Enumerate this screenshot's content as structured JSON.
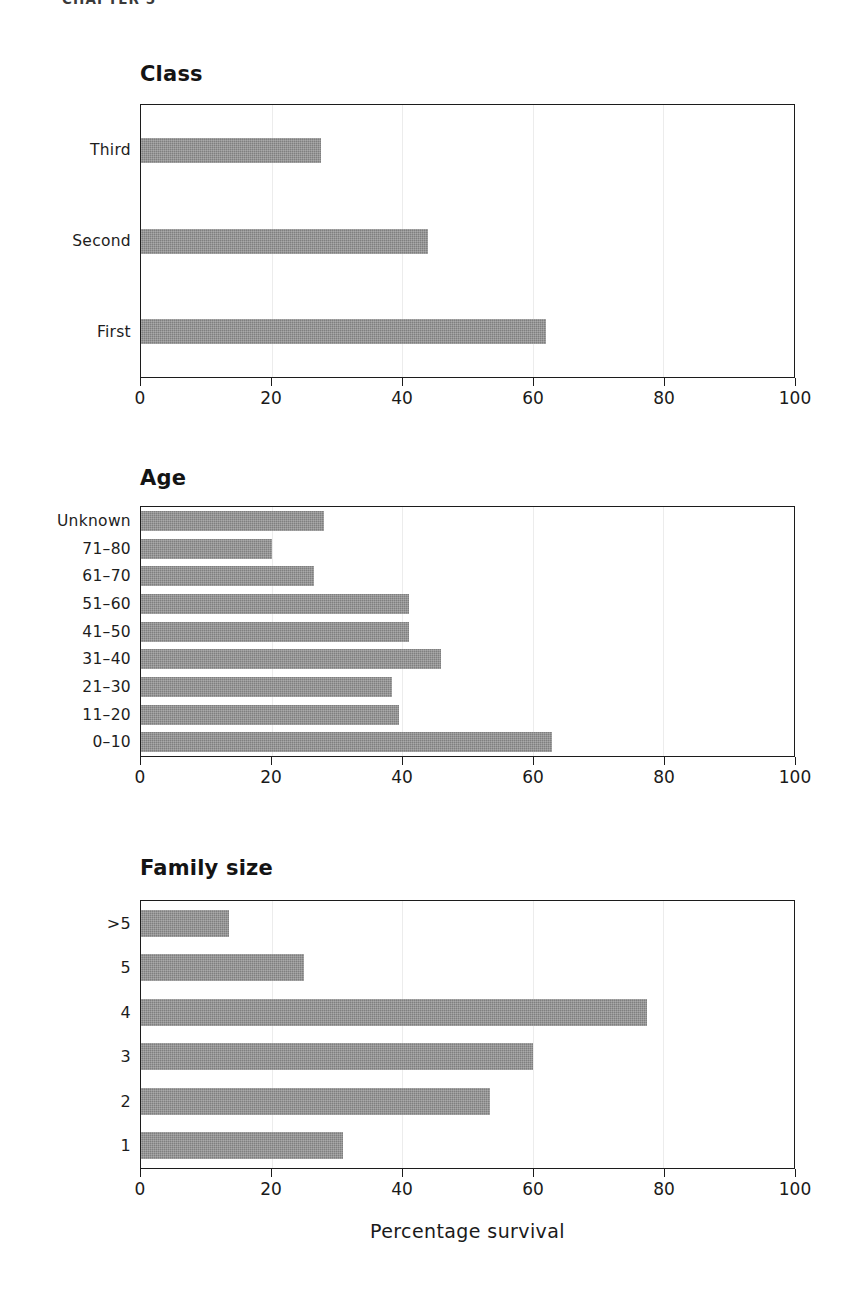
{
  "running_head": "CHAPTER 5",
  "axis": {
    "title": "Percentage survival",
    "ticks": [
      0,
      20,
      40,
      60,
      80,
      100
    ],
    "tick_labels": [
      "0",
      "20",
      "40",
      "60",
      "80",
      "100"
    ],
    "min": 0,
    "max": 100
  },
  "colors": {
    "bar_fill": "#7f7f7f",
    "frame": "#1c1c1c",
    "gridline": "#ececec",
    "text": "#1a1a1a",
    "background": "#ffffff"
  },
  "panels": [
    {
      "id": "class",
      "title": "Class",
      "categories": [
        "Third",
        "Second",
        "First"
      ],
      "values": [
        27.5,
        44.0,
        62.0
      ]
    },
    {
      "id": "age",
      "title": "Age",
      "categories": [
        "Unknown",
        "71–80",
        "61–70",
        "51–60",
        "41–50",
        "31–40",
        "21–30",
        "11–20",
        "0–10"
      ],
      "values": [
        28.0,
        20.0,
        26.5,
        41.0,
        41.0,
        46.0,
        38.5,
        39.5,
        63.0
      ]
    },
    {
      "id": "family",
      "title": "Family size",
      "categories": [
        ">5",
        "5",
        "4",
        "3",
        "2",
        "1"
      ],
      "values": [
        13.5,
        25.0,
        77.5,
        60.0,
        53.5,
        31.0
      ]
    }
  ],
  "chart_data": [
    {
      "type": "bar",
      "orientation": "horizontal",
      "title": "Class",
      "categories": [
        "Third",
        "Second",
        "First"
      ],
      "values": [
        27.5,
        44.0,
        62.0
      ],
      "xlabel": "Percentage survival",
      "ylabel": "",
      "xlim": [
        0,
        100
      ],
      "xticks": [
        0,
        20,
        40,
        60,
        80,
        100
      ],
      "grid": true,
      "legend": "none"
    },
    {
      "type": "bar",
      "orientation": "horizontal",
      "title": "Age",
      "categories": [
        "Unknown",
        "71–80",
        "61–70",
        "51–60",
        "41–50",
        "31–40",
        "21–30",
        "11–20",
        "0–10"
      ],
      "values": [
        28.0,
        20.0,
        26.5,
        41.0,
        41.0,
        46.0,
        38.5,
        39.5,
        63.0
      ],
      "xlabel": "Percentage survival",
      "ylabel": "",
      "xlim": [
        0,
        100
      ],
      "xticks": [
        0,
        20,
        40,
        60,
        80,
        100
      ],
      "grid": true,
      "legend": "none"
    },
    {
      "type": "bar",
      "orientation": "horizontal",
      "title": "Family size",
      "categories": [
        ">5",
        "5",
        "4",
        "3",
        "2",
        "1"
      ],
      "values": [
        13.5,
        25.0,
        77.5,
        60.0,
        53.5,
        31.0
      ],
      "xlabel": "Percentage survival",
      "ylabel": "",
      "xlim": [
        0,
        100
      ],
      "xticks": [
        0,
        20,
        40,
        60,
        80,
        100
      ],
      "grid": true,
      "legend": "none"
    }
  ]
}
